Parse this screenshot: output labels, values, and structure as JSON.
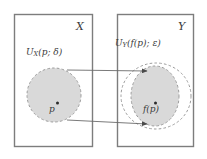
{
  "figure": {
    "type": "diagram",
    "colors": {
      "box_border": "#7d7d7d",
      "region_fill": "#d8d8d8",
      "region_stroke": "#9a9a9a",
      "arrow": "#6b6b6b",
      "text": "#3a3a3a",
      "background": "#ffffff"
    }
  },
  "domain_box": {
    "set_label": "X",
    "neighborhood_label_prefix": "U",
    "neighborhood_label_sub": "X",
    "neighborhood_label_args": "(p; δ)",
    "neighborhood_label_full": "U_X(p; δ)",
    "point_label": "p",
    "geometry": {
      "x": 14,
      "y": 14,
      "width": 78,
      "height": 132
    },
    "disk": {
      "cx": 54,
      "cy": 95,
      "rx": 27,
      "ry": 27,
      "style": "dashed"
    }
  },
  "codomain_box": {
    "set_label": "Y",
    "neighborhood_label_prefix": "U",
    "neighborhood_label_sub": "Y",
    "neighborhood_label_args": "(f(p); ε)",
    "neighborhood_label_full": "U_Y(f(p); ε)",
    "point_label_function": "f",
    "point_label_args": "(p)",
    "point_label_full": "f(p)",
    "geometry": {
      "x": 117,
      "y": 14,
      "width": 76,
      "height": 132
    },
    "outer_ellipse": {
      "cx": 156,
      "cy": 96,
      "rx": 36,
      "ry": 34,
      "style": "dashed",
      "filled": false
    },
    "inner_ellipse": {
      "cx": 155,
      "cy": 96,
      "rx": 24,
      "ry": 30,
      "style": "dashed",
      "filled": true
    }
  },
  "arrows": [
    {
      "name": "upper-mapping-arrow",
      "x1": 67,
      "y1": 70,
      "x2": 148,
      "y2": 71
    },
    {
      "name": "lower-mapping-arrow",
      "x1": 67,
      "y1": 120,
      "x2": 148,
      "y2": 124
    }
  ]
}
